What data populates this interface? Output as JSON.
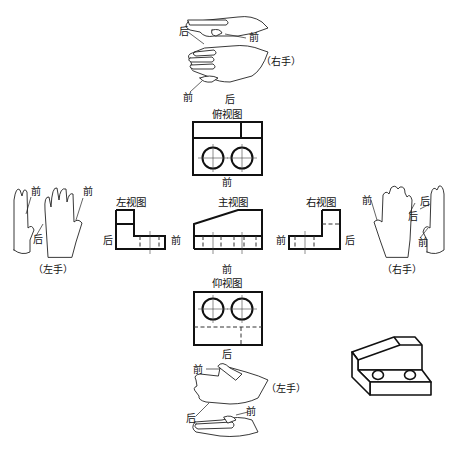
{
  "views": {
    "top": {
      "title": "俯视图",
      "front_label": "前",
      "back_label": "后"
    },
    "front": {
      "title": "主视图",
      "below_label": "前"
    },
    "left": {
      "title": "左视图",
      "back_label": "后",
      "front_label": "前"
    },
    "right": {
      "title": "右视图",
      "front_label": "前",
      "back_label": "后"
    },
    "bottom": {
      "title": "仰视图",
      "front_label": "前",
      "back_label": "后"
    }
  },
  "hands": {
    "top": {
      "caption": "（右手）",
      "labels": [
        "后",
        "前",
        "前",
        "后"
      ]
    },
    "left": {
      "caption": "（左手）",
      "labels": [
        "前",
        "后",
        "前"
      ]
    },
    "right": {
      "caption": "（右手）",
      "labels": [
        "前",
        "后",
        "后",
        "前"
      ]
    },
    "bottom": {
      "caption": "（左手）",
      "labels": [
        "前",
        "后",
        "前"
      ]
    }
  },
  "isometric": {
    "name": "3D block with two holes"
  },
  "colors": {
    "line": "#111111",
    "background": "#ffffff"
  }
}
